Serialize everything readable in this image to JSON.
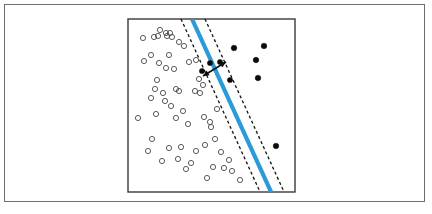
{
  "figure": {
    "kind": "svm-maximum-margin-classifier-illustration",
    "outer_frame": {
      "x": 4,
      "y": 4,
      "width": 421,
      "height": 198,
      "stroke": "#6e6e6e"
    },
    "background_color": "#ffffff"
  },
  "chart_data": {
    "type": "scatter",
    "title": "",
    "subtitle": "",
    "xlabel": "",
    "ylabel": "",
    "xlim": [
      0,
      100
    ],
    "ylim": [
      0,
      100
    ],
    "grid": false,
    "legend": null,
    "axis_ticks": {
      "x": [],
      "y": []
    },
    "plot_area_px": {
      "x": 128,
      "y": 19,
      "width": 167,
      "height": 173
    },
    "colors": {
      "decision_boundary": "#2a9bd8",
      "margin_boundary": "#111111",
      "class_negative_stroke": "#4a4a4a",
      "class_positive_fill": "#0b0b0b",
      "plot_border": "#3a3a3a"
    },
    "series": [
      {
        "name": "class-negative",
        "marker": "open-circle",
        "marker_radius_px": 2.6,
        "color": "#4a4a4a",
        "points": [
          [
            143,
            38
          ],
          [
            160,
            30
          ],
          [
            166,
            33
          ],
          [
            170,
            33
          ],
          [
            167,
            36
          ],
          [
            172,
            37
          ],
          [
            154,
            37
          ],
          [
            158,
            36
          ],
          [
            179,
            42
          ],
          [
            184,
            46
          ],
          [
            151,
            55
          ],
          [
            159,
            63
          ],
          [
            169,
            55
          ],
          [
            174,
            69
          ],
          [
            144,
            61
          ],
          [
            166,
            68
          ],
          [
            189,
            62
          ],
          [
            196,
            60
          ],
          [
            157,
            80
          ],
          [
            155,
            89
          ],
          [
            163,
            93
          ],
          [
            176,
            89
          ],
          [
            179,
            91
          ],
          [
            195,
            91
          ],
          [
            200,
            93
          ],
          [
            199,
            79
          ],
          [
            203,
            85
          ],
          [
            151,
            98
          ],
          [
            165,
            101
          ],
          [
            171,
            106
          ],
          [
            183,
            111
          ],
          [
            138,
            118
          ],
          [
            156,
            114
          ],
          [
            176,
            118
          ],
          [
            188,
            124
          ],
          [
            204,
            117
          ],
          [
            210,
            122
          ],
          [
            211,
            127
          ],
          [
            217,
            109
          ],
          [
            152,
            139
          ],
          [
            148,
            151
          ],
          [
            169,
            148
          ],
          [
            181,
            147
          ],
          [
            205,
            145
          ],
          [
            215,
            139
          ],
          [
            178,
            159
          ],
          [
            191,
            163
          ],
          [
            162,
            161
          ],
          [
            196,
            151
          ],
          [
            221,
            152
          ],
          [
            229,
            160
          ],
          [
            224,
            168
          ],
          [
            232,
            171
          ],
          [
            213,
            167
          ],
          [
            240,
            180
          ],
          [
            207,
            178
          ],
          [
            186,
            169
          ]
        ]
      },
      {
        "name": "class-positive",
        "marker": "filled-circle",
        "marker_radius_px": 2.8,
        "color": "#0b0b0b",
        "points": [
          [
            234,
            48
          ],
          [
            264,
            46
          ],
          [
            256,
            60
          ],
          [
            258,
            78
          ],
          [
            276,
            146
          ]
        ]
      },
      {
        "name": "support-vectors",
        "marker": "filled-circle",
        "marker_radius_px": 2.6,
        "color": "#0b0b0b",
        "points": [
          [
            210,
            63
          ],
          [
            220,
            62
          ],
          [
            202,
            71
          ],
          [
            230,
            80
          ]
        ]
      }
    ],
    "decision_boundary": {
      "label": "separating hyperplane",
      "stroke": "#2a9bd8",
      "stroke_width_px": 4.2,
      "x1": 192,
      "y1": 19,
      "x2": 272,
      "y2": 194
    },
    "margin_boundaries": [
      {
        "label": "negative margin",
        "x1": 181,
        "y1": 19,
        "x2": 261,
        "y2": 194
      },
      {
        "label": "positive margin",
        "x1": 205,
        "y1": 19,
        "x2": 285,
        "y2": 194
      }
    ],
    "margin_indicator": {
      "label": "margin width double arrow",
      "x1": 203,
      "y1": 76,
      "x2": 226,
      "y2": 62
    },
    "annotations": []
  }
}
